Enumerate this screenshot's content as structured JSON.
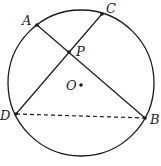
{
  "figure": {
    "colors": {
      "stroke": "#1a1a1a",
      "background": "#ffffff"
    },
    "circle": {
      "cx": 81,
      "cy": 83,
      "r": 73
    },
    "points": {
      "A": {
        "x": 37,
        "y": 25,
        "label": "A",
        "lx": 22,
        "ly": 25
      },
      "C": {
        "x": 102,
        "y": 14,
        "label": "C",
        "lx": 106,
        "ly": 13
      },
      "P": {
        "x": 69,
        "y": 52,
        "label": "P",
        "lx": 76,
        "ly": 56
      },
      "O": {
        "x": 81,
        "y": 85,
        "label": "O",
        "lx": 66,
        "ly": 90
      },
      "D": {
        "x": 16,
        "y": 114,
        "label": "D",
        "lx": 0,
        "ly": 120
      },
      "B": {
        "x": 145,
        "y": 118,
        "label": "B",
        "lx": 150,
        "ly": 124
      }
    },
    "segments": [
      {
        "from": "A",
        "to": "B",
        "style": "solid"
      },
      {
        "from": "C",
        "to": "D",
        "style": "solid"
      },
      {
        "from": "D",
        "to": "B",
        "style": "dashed"
      }
    ]
  }
}
